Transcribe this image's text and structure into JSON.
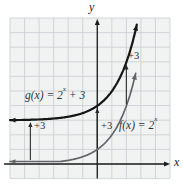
{
  "figure_title": "Graph of f(x) = 2^x and its vertical shift g(x) = 2^x + 3",
  "colors": {
    "page_bg": "#ffffff",
    "plot_bg": "#f1f2f2",
    "grid_line": "#c9cdd1",
    "axis": "#1c1c1c",
    "f_curve": "#60666b",
    "g_curve": "#161616",
    "shift_arrow": "#2b2b2b",
    "text": "#2e3236"
  },
  "labels": {
    "g": {
      "pre": "g(x) = 2",
      "sup": "x",
      "post": " + 3"
    },
    "f": {
      "pre": "f(x) = 2",
      "sup": "x"
    },
    "shift": "+3",
    "x_axis": "x",
    "y_axis": "y"
  },
  "chart_data": {
    "type": "line",
    "title": "",
    "xlabel": "x",
    "ylabel": "y",
    "grid": true,
    "axes": {
      "x_range": [
        -6,
        5
      ],
      "y_range": [
        -1,
        10
      ]
    },
    "functions": [
      {
        "name": "f",
        "expression": "f(x) = 2^x",
        "base": 2,
        "shift": 0,
        "x_range": [
          -6,
          2.67
        ],
        "stroke_width": 1.7,
        "color_key": "f_curve",
        "key_points": [
          [
            -2,
            0.25
          ],
          [
            -1,
            0.5
          ],
          [
            0,
            1
          ],
          [
            1,
            2
          ],
          [
            2,
            4
          ]
        ]
      },
      {
        "name": "g",
        "expression": "g(x) = 2^x + 3",
        "base": 2,
        "shift": 3,
        "x_range": [
          -6,
          2.72
        ],
        "stroke_width": 2.2,
        "color_key": "g_curve",
        "key_points": [
          [
            -2,
            3.25
          ],
          [
            -1,
            3.5
          ],
          [
            0,
            4
          ],
          [
            1,
            5
          ],
          [
            2,
            7
          ]
        ]
      }
    ],
    "shift_arrows": [
      {
        "x": -4.6,
        "label": "+3"
      },
      {
        "x": 0,
        "label": "+3"
      },
      {
        "x": 2,
        "label": "+3"
      }
    ],
    "annotation": "Each arrow shows the vertical translation of +3 units from f to g"
  }
}
